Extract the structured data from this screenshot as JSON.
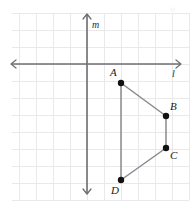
{
  "figure": {
    "kind": "coordinate-geometry-quadrilateral",
    "background_color": "#ffffff",
    "grid": {
      "visible": true,
      "color": "#e9e9ec",
      "spacing_px": 17,
      "origin_px": {
        "x": 87,
        "y": 64
      },
      "x_start_px": 12,
      "x_end_px": 189,
      "y_start_px": 13,
      "y_end_px": 200
    },
    "axes": [
      {
        "name": "l",
        "label": "l",
        "orientation": "horizontal",
        "color": "#6e6e73",
        "position_px": 64,
        "from_px": 11,
        "to_px": 181,
        "arrows": "both",
        "label_px": {
          "x": 172,
          "y": 77
        }
      },
      {
        "name": "m",
        "label": "m",
        "orientation": "vertical",
        "color": "#6e6e73",
        "position_px": 87,
        "from_px": 14,
        "to_px": 194,
        "arrows": "both",
        "label_px": {
          "x": 92,
          "y": 28
        }
      }
    ],
    "shape": {
      "type": "quadrilateral",
      "name": "ABCD",
      "closed": true,
      "edge_color": "#8a8a8e",
      "vertex_color": "#111111",
      "vertex_radius_px": 3.2,
      "vertices": [
        {
          "label": "A",
          "px": {
            "x": 121,
            "y": 83
          },
          "grid": {
            "x": 2,
            "y": -1
          },
          "label_px": {
            "x": 110,
            "y": 76
          }
        },
        {
          "label": "B",
          "px": {
            "x": 166,
            "y": 116
          },
          "grid": {
            "x": 4.65,
            "y": -3
          },
          "label_px": {
            "x": 170,
            "y": 110
          }
        },
        {
          "label": "C",
          "px": {
            "x": 166,
            "y": 148
          },
          "grid": {
            "x": 4.65,
            "y": -4.9
          },
          "label_px": {
            "x": 170,
            "y": 159
          }
        },
        {
          "label": "D",
          "px": {
            "x": 121,
            "y": 180
          },
          "grid": {
            "x": 2,
            "y": -6.8
          },
          "label_px": {
            "x": 111,
            "y": 194
          }
        }
      ],
      "edges": [
        {
          "from": "A",
          "to": "B"
        },
        {
          "from": "B",
          "to": "C"
        },
        {
          "from": "C",
          "to": "D"
        },
        {
          "from": "D",
          "to": "A"
        }
      ]
    },
    "watermark": {
      "text": "⊕",
      "px": {
        "x": 170,
        "y": 12
      }
    }
  }
}
